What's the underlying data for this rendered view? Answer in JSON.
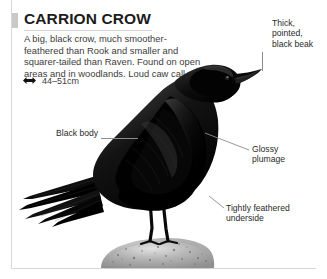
{
  "page": {
    "title": "CARRION CROW",
    "description": "A big, black crow, much smoother-feathered than Rook and smaller and squarer-tailed than Raven. Found on open areas and in woodlands. Loud caw call.",
    "size_icon": "size-range-arrow-icon",
    "size_text": "44–51cm"
  },
  "illustration": {
    "subject": "carrion-crow-perched-on-rock",
    "subject_color": "#000000",
    "perch": "gray-speckled-rock",
    "perch_color": "#a9a9a9",
    "background": "#ffffff"
  },
  "callouts": [
    {
      "id": "beak",
      "text": "Thick,\npointed,\nblack beak",
      "line1": "Thick,",
      "line2": "pointed,",
      "line3": "black beak"
    },
    {
      "id": "body",
      "text": "Black body"
    },
    {
      "id": "glossy",
      "line1": "Glossy",
      "line2": "plumage"
    },
    {
      "id": "underside",
      "line1": "Tightly feathered",
      "line2": "underside"
    }
  ],
  "colors": {
    "title": "#1c1c1c",
    "body_text": "#3c3c3c",
    "callout_text": "#2a2a2a",
    "leader_line": "#8c8c8c",
    "rule": "#d8d8d8",
    "title_tab": "#c9c9c9"
  }
}
